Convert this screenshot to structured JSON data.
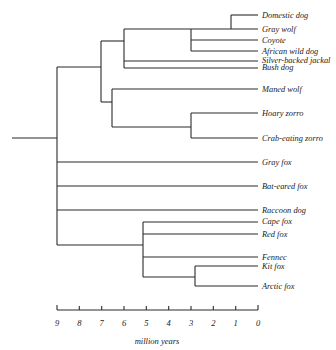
{
  "diagram": {
    "type": "phylogenetic-tree",
    "axis": {
      "label": "million years",
      "ticks": [
        "9",
        "8",
        "7",
        "6",
        "5",
        "4",
        "3",
        "2",
        "1",
        "0"
      ]
    },
    "leaves": [
      {
        "name": "Domestic dog"
      },
      {
        "name": "Gray wolf"
      },
      {
        "name": "Coyote"
      },
      {
        "name": "African wild dog"
      },
      {
        "name": "Silver-backed jackal"
      },
      {
        "name": "Bush dog"
      },
      {
        "name": "Maned wolf"
      },
      {
        "name": "Hoary zorro"
      },
      {
        "name": "Crab-eating zorro"
      },
      {
        "name": "Gray fox"
      },
      {
        "name": "Bat-eared fox"
      },
      {
        "name": "Raccoon dog"
      },
      {
        "name": "Cape fox"
      },
      {
        "name": "Red fox"
      },
      {
        "name": "Fennec"
      },
      {
        "name": "Kit fox"
      },
      {
        "name": "Arctic fox"
      }
    ]
  }
}
